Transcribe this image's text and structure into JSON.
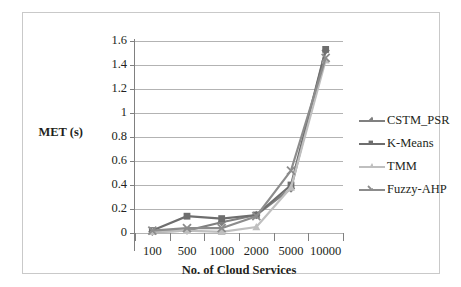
{
  "chart_data": {
    "type": "line",
    "title": "",
    "xlabel": "No. of Cloud Services",
    "ylabel": "MET (s)",
    "categories": [
      "100",
      "500",
      "1000",
      "2000",
      "5000",
      "10000"
    ],
    "ylim": [
      0,
      1.6
    ],
    "ytick_labels": [
      "0",
      "0.2",
      "0.4",
      "0.6",
      "0.8",
      "1",
      "1.2",
      "1.4",
      "1.6"
    ],
    "ytick_values": [
      0,
      0.2,
      0.4,
      0.6,
      0.8,
      1.0,
      1.2,
      1.4,
      1.6
    ],
    "grid": true,
    "legend_position": "right",
    "series": [
      {
        "name": "CSTM_PSR",
        "marker": "diamond",
        "color": "#808080",
        "values": [
          0.01,
          0.02,
          0.09,
          0.15,
          0.37,
          1.52
        ]
      },
      {
        "name": "K-Means",
        "marker": "square",
        "color": "#6e6e6e",
        "values": [
          0.02,
          0.14,
          0.12,
          0.15,
          0.4,
          1.53
        ]
      },
      {
        "name": "TMM",
        "marker": "triangle",
        "color": "#bfbfbf",
        "values": [
          0.01,
          0.02,
          0.01,
          0.05,
          0.38,
          1.44
        ]
      },
      {
        "name": "Fuzzy-AHP",
        "marker": "cross",
        "color": "#8c8c8c",
        "values": [
          0.02,
          0.04,
          0.04,
          0.14,
          0.52,
          1.46
        ]
      }
    ]
  },
  "axis": {
    "y_title": "MET (s)",
    "x_title": "No. of Cloud Services"
  },
  "legend": {
    "items": [
      {
        "label": "CSTM_PSR"
      },
      {
        "label": "K-Means"
      },
      {
        "label": "TMM"
      },
      {
        "label": "Fuzzy-AHP"
      }
    ]
  }
}
